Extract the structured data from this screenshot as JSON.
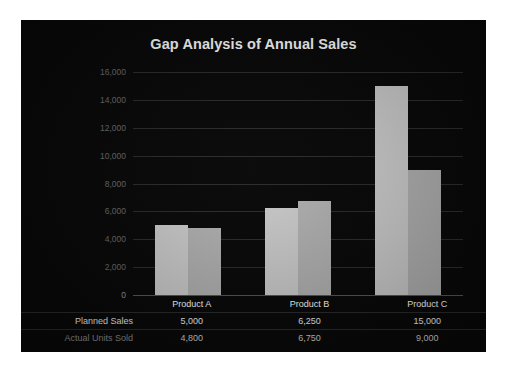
{
  "chart_data": {
    "type": "bar",
    "title": "Gap Analysis of Annual Sales",
    "xlabel": "",
    "ylabel": "",
    "categories": [
      "Product A",
      "Product B",
      "Product C"
    ],
    "series": [
      {
        "name": "Planned Sales",
        "values": [
          5000,
          6250,
          15000
        ],
        "color": "#cccccc",
        "labels": [
          "5,000",
          "6,250",
          "15,000"
        ]
      },
      {
        "name": "Actual Units Sold",
        "values": [
          4800,
          6750,
          9000
        ],
        "color": "#b2b2b2",
        "labels": [
          "4,800",
          "6,750",
          "9,000"
        ]
      }
    ],
    "ylim": [
      0,
      16000
    ],
    "ytick_values": [
      16000,
      14000,
      12000,
      10000,
      8000,
      6000,
      4000,
      2000,
      0
    ],
    "ytick_labels": [
      "16,000",
      "14,000",
      "12,000",
      "10,000",
      "8,000",
      "6,000",
      "4,000",
      "2,000",
      "0"
    ],
    "grid": true,
    "legend": "none",
    "data_table_shown": true
  },
  "panel": {
    "background": "#080808",
    "title_color": "#ffffff"
  },
  "table": {
    "corner_label": "",
    "row_labels": [
      "Planned Sales",
      "Actual Units Sold"
    ]
  }
}
